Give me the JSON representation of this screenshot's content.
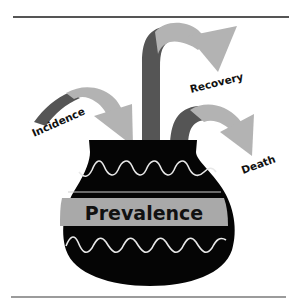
{
  "diagram": {
    "type": "bathtub-pot-flow",
    "container_label": "Prevalence",
    "inflows": [
      {
        "label": "Incidence"
      }
    ],
    "outflows": [
      {
        "label": "Recovery"
      },
      {
        "label": "Death"
      }
    ],
    "colors": {
      "background": "#ffffff",
      "rule": "#555555",
      "pot_body": "#050505",
      "pot_band": "#a9a9a9",
      "pot_wave": "#e8e8e8",
      "arrow_dark": "#555555",
      "arrow_light": "#b3b3b3",
      "text": "#111111"
    }
  }
}
